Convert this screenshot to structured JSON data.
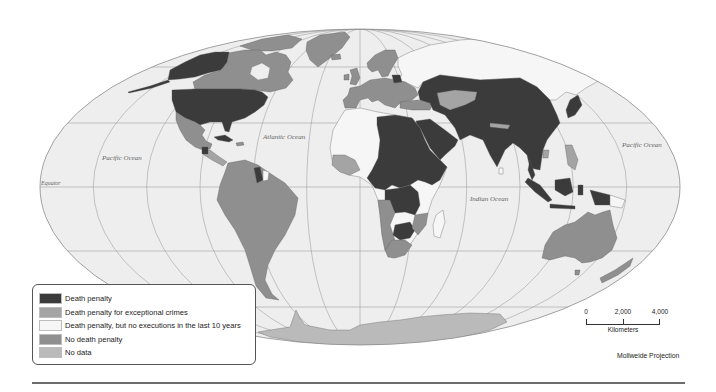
{
  "map": {
    "ocean_labels": {
      "pacific_west": "Pacific Ocean",
      "atlantic": "Atlantic Ocean",
      "indian": "Indian Ocean",
      "pacific_east": "Pacific Ocean"
    },
    "equator_label": "Equator",
    "projection_label": "Mollweide Projection",
    "ocean_color": "#eeeeee"
  },
  "legend": {
    "items": [
      {
        "category": "death_penalty",
        "label": "Death penalty",
        "color": "#3b3b3b"
      },
      {
        "category": "exceptional",
        "label": "Death penalty for exceptional crimes",
        "color": "#a4a4a4"
      },
      {
        "category": "no_executions",
        "label": "Death penalty, but no executions in the last 10 years",
        "color": "#f6f6f6"
      },
      {
        "category": "no_death_penalty",
        "label": "No death penalty",
        "color": "#8f8f8f"
      },
      {
        "category": "no_data",
        "label": "No data",
        "color": "#bababa"
      }
    ]
  },
  "scale_bar": {
    "ticks": [
      "0",
      "2,000",
      "4,000"
    ],
    "unit": "Kilometers"
  }
}
